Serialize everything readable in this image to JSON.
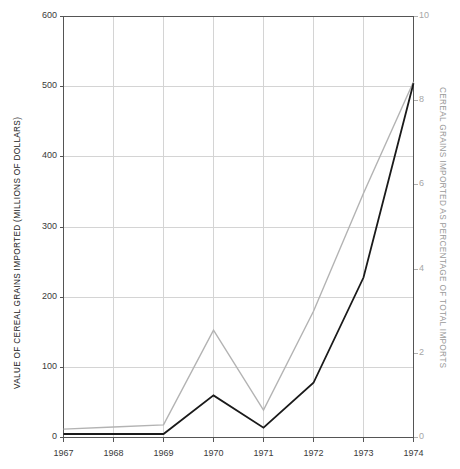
{
  "chart_data": {
    "type": "line",
    "title": "",
    "subtitle": "",
    "xlabel": "",
    "ylabel": "VALUE OF CEREAL GRAINS IMPORTED (MILLIONS OF DOLLARS)",
    "y2label": "CEREAL GRAINS IMPORTED AS PERCENTAGE OF TOTAL IMPORTS",
    "categories": [
      "1967",
      "1968",
      "1969",
      "1970",
      "1971",
      "1972",
      "1973",
      "1974"
    ],
    "x": [
      1967,
      1968,
      1969,
      1970,
      1971,
      1972,
      1973,
      1974
    ],
    "xlim": [
      1967,
      1974
    ],
    "ylim": [
      0,
      600
    ],
    "y2lim": [
      0,
      10
    ],
    "yticks": [
      0,
      100,
      200,
      300,
      400,
      500,
      600
    ],
    "ytick_labels": [
      "0",
      "100",
      "200",
      "300",
      "400",
      "500",
      "600"
    ],
    "y2ticks": [
      0,
      2,
      4,
      6,
      8,
      10
    ],
    "y2tick_labels": [
      "0",
      "2",
      "4",
      "6",
      "8",
      "10"
    ],
    "xticks": [
      1967,
      1968,
      1969,
      1970,
      1971,
      1972,
      1973,
      1974
    ],
    "xtick_labels": [
      "1967",
      "1968",
      "1969",
      "1970",
      "1971",
      "1972",
      "1973",
      "1974"
    ],
    "grid": true,
    "grid_axis": "both",
    "legend": false,
    "legend_position": "none",
    "series": [
      {
        "name": "VALUE OF CEREAL GRAINS IMPORTED (MILLIONS OF DOLLARS)",
        "axis": "left",
        "color": "#1a1a1a",
        "width": 1.8,
        "values": [
          5,
          5,
          5,
          60,
          14,
          78,
          228,
          505
        ]
      },
      {
        "name": "CEREAL GRAINS IMPORTED AS PERCENTAGE OF TOTAL IMPORTS",
        "axis": "right",
        "color": "#b3b3b3",
        "width": 1.4,
        "values": [
          0.2,
          0.25,
          0.3,
          2.55,
          0.65,
          3.0,
          5.8,
          8.45
        ]
      }
    ]
  },
  "colors": {
    "background": "#ffffff",
    "frame": "#555555",
    "grid": "#d4d4d4",
    "left_series": "#1a1a1a",
    "right_series": "#b3b3b3",
    "left_axis_text": "#2b2b2b",
    "right_axis_text": "#9a9a9a"
  }
}
